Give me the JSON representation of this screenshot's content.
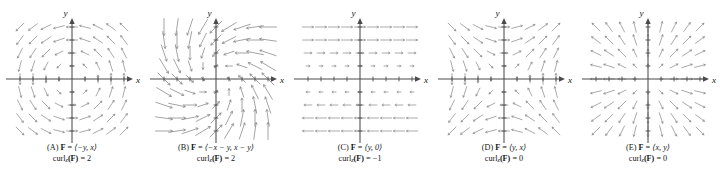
{
  "figure": {
    "width": 720,
    "height": 188,
    "background": "#ffffff",
    "arrow_color": "#8d8d8d",
    "axis_color": "#4a4a4a",
    "text_color": "#161616"
  },
  "axes": {
    "x_label": "x",
    "y_label": "y",
    "tick_count_per_side": 4,
    "show_ticks": true
  },
  "panels": [
    {
      "id": "A",
      "letter": "(A)",
      "field_prefix": "F",
      "field_equals": "=",
      "field_components": "⟨−y, x⟩",
      "curl_label": "curl",
      "curl_sub": "z",
      "curl_arg": "(F)",
      "curl_equals": "=",
      "curl_value": "2",
      "plot": {
        "fx": "-y",
        "fy": "x",
        "grid_n": 9,
        "extent": 4,
        "scale": 0.3,
        "arrow_style": "short",
        "head_size": 1.7,
        "stroke_width": 0.75
      }
    },
    {
      "id": "B",
      "letter": "(B)",
      "field_prefix": "F",
      "field_equals": "=",
      "field_components": "⟨−x − y, x − y⟩",
      "curl_label": "curl",
      "curl_sub": "z",
      "curl_arg": "(F)",
      "curl_equals": "=",
      "curl_value": "2",
      "plot": {
        "fx": "-x-y",
        "fy": "x-y",
        "grid_n": 9,
        "extent": 4,
        "scale": 0.26,
        "arrow_style": "long",
        "head_size": 2.1,
        "stroke_width": 0.8
      }
    },
    {
      "id": "C",
      "letter": "(C)",
      "field_prefix": "F",
      "field_equals": "=",
      "field_components": "⟨y, 0⟩",
      "curl_label": "curl",
      "curl_sub": "z",
      "curl_arg": "(F)",
      "curl_equals": "=",
      "curl_value": "−1",
      "plot": {
        "fx": "y",
        "fy": "0",
        "grid_n": 9,
        "extent": 4,
        "scale": 0.3,
        "arrow_style": "short",
        "head_size": 1.7,
        "stroke_width": 0.75
      }
    },
    {
      "id": "D",
      "letter": "(D)",
      "field_prefix": "F",
      "field_equals": "=",
      "field_components": "⟨y, x⟩",
      "curl_label": "curl",
      "curl_sub": "z",
      "curl_arg": "(F)",
      "curl_equals": "=",
      "curl_value": "0",
      "plot": {
        "fx": "y",
        "fy": "x",
        "grid_n": 9,
        "extent": 4,
        "scale": 0.3,
        "arrow_style": "short",
        "head_size": 1.7,
        "stroke_width": 0.75
      }
    },
    {
      "id": "E",
      "letter": "(E)",
      "field_prefix": "F",
      "field_equals": "=",
      "field_components": "⟨x, y⟩",
      "curl_label": "curl",
      "curl_sub": "z",
      "curl_arg": "(F)",
      "curl_equals": "=",
      "curl_value": "0",
      "plot": {
        "fx": "x",
        "fy": "y",
        "grid_n": 9,
        "extent": 4,
        "scale": 0.3,
        "arrow_style": "short",
        "head_size": 1.7,
        "stroke_width": 0.75
      }
    }
  ]
}
